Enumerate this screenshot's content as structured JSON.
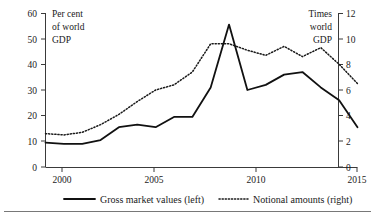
{
  "chart_data": {
    "type": "line",
    "title": "",
    "subtitle": "",
    "xlabel": "",
    "ylabel": "Per cent of world GDP",
    "y2label": "Times world GDP",
    "ylabel_lines": [
      "Per cent",
      "of world",
      "GDP"
    ],
    "y2label_lines": [
      "Times",
      "world",
      "GDP"
    ],
    "grid": false,
    "legend_position": "bottom",
    "xlim": [
      1998,
      2015
    ],
    "ylim": [
      0,
      60
    ],
    "y2lim": [
      0,
      12
    ],
    "xticks": [
      2000,
      2005,
      2010,
      2015
    ],
    "xtick_labels": [
      "2000",
      "2005",
      "2010",
      "2015"
    ],
    "yticks": [
      0,
      10,
      20,
      30,
      40,
      50,
      60
    ],
    "ytick_labels": [
      "0",
      "10",
      "20",
      "30",
      "40",
      "50",
      "60"
    ],
    "y2ticks": [
      0,
      2,
      4,
      6,
      8,
      10,
      12
    ],
    "y2tick_labels": [
      "0",
      "2",
      "4",
      "6",
      "8",
      "10",
      "12"
    ],
    "x": [
      1998,
      1999,
      2000,
      2001,
      2002,
      2003,
      2004,
      2005,
      2006,
      2007,
      2008,
      2009,
      2010,
      2011,
      2012,
      2013,
      2014,
      2015
    ],
    "series": [
      {
        "name": "Gross market values (left)",
        "axis": "left",
        "style": "solid",
        "unit": "per cent of world GDP",
        "values": [
          9.5,
          9.0,
          9.0,
          10.5,
          15.5,
          16.5,
          15.5,
          19.5,
          19.5,
          31.0,
          55.5,
          30.0,
          32.0,
          36.0,
          37.0,
          31.0,
          26.0,
          15.5
        ]
      },
      {
        "name": "Notional amounts (right)",
        "axis": "right",
        "style": "dotted",
        "unit": "times world GDP",
        "values": [
          2.6,
          2.5,
          2.7,
          3.3,
          4.1,
          5.1,
          6.0,
          6.4,
          7.4,
          9.6,
          9.6,
          9.1,
          8.7,
          9.4,
          8.6,
          9.3,
          8.0,
          6.5
        ]
      }
    ]
  },
  "legend": {
    "items": [
      {
        "label": "Gross market values (left)",
        "style": "solid"
      },
      {
        "label": "Notional amounts (right)",
        "style": "dotted"
      }
    ]
  },
  "colors": {
    "series_solid": "#111111",
    "series_dotted": "#1a1a1a",
    "axis": "#3a3a3a",
    "text": "#1a1a1a",
    "background": "#ffffff"
  }
}
